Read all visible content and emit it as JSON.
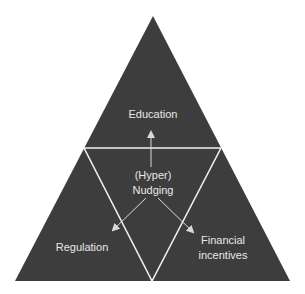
{
  "diagram": {
    "type": "triangle-framework",
    "colors": {
      "background": "#ffffff",
      "triangle_fill": "#3d3d3d",
      "divider_lines": "#f2f2f2",
      "arrows": "#d9d9d9",
      "text": "#e8e8e8"
    },
    "outer_triangle": {
      "apex": [
        153,
        16
      ],
      "bottom_left": [
        15,
        281
      ],
      "bottom_right": [
        290,
        281
      ]
    },
    "center": {
      "line1": "(Hyper)",
      "line2": "Nudging"
    },
    "corners": {
      "top": {
        "label": "Education"
      },
      "bottom_left": {
        "label": "Regulation"
      },
      "bottom_right": {
        "line1": "Financial",
        "line2": "incentives"
      }
    },
    "arrows": [
      {
        "from": "center",
        "to": "top",
        "target": "Education"
      },
      {
        "from": "center",
        "to": "bottom_left",
        "target": "Regulation"
      },
      {
        "from": "center",
        "to": "bottom_right",
        "target": "Financial incentives"
      }
    ]
  }
}
